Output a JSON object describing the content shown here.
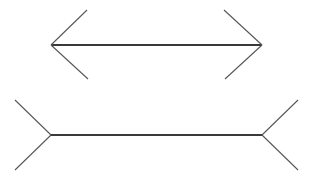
{
  "canvas": {
    "width": 311,
    "height": 178,
    "background": "#ffffff",
    "title": "Muller-Lyer illusion figure"
  },
  "style": {
    "shaft_color": "#3a3a3a",
    "shaft_width": 1.6,
    "fin_color": "#545454",
    "fin_width": 1.05
  },
  "figures": [
    {
      "name": "top-figure",
      "description": "horizontal line with outward-pointing arrowheads (arrows-in / wings pointing outward from ends)",
      "shaft": {
        "x1": 51,
        "y1": 45,
        "x2": 262,
        "y2": 45,
        "length": 211
      },
      "fins": [
        {
          "name": "top-left-upper-fin",
          "x1": 51,
          "y1": 45,
          "x2": 87,
          "y2": 10
        },
        {
          "name": "top-left-lower-fin",
          "x1": 51,
          "y1": 45,
          "x2": 88,
          "y2": 79
        },
        {
          "name": "top-right-upper-fin",
          "x1": 262,
          "y1": 45,
          "x2": 224,
          "y2": 10
        },
        {
          "name": "top-right-lower-fin",
          "x1": 262,
          "y1": 45,
          "x2": 225,
          "y2": 79
        }
      ]
    },
    {
      "name": "bottom-figure",
      "description": "horizontal line with outward-spreading fins (arrows-out / tails)",
      "shaft": {
        "x1": 51,
        "y1": 135,
        "x2": 262,
        "y2": 135,
        "length": 211
      },
      "fins": [
        {
          "name": "bottom-left-upper-fin",
          "x1": 51,
          "y1": 135,
          "x2": 15,
          "y2": 100
        },
        {
          "name": "bottom-left-lower-fin",
          "x1": 51,
          "y1": 135,
          "x2": 15,
          "y2": 170
        },
        {
          "name": "bottom-right-upper-fin",
          "x1": 262,
          "y1": 135,
          "x2": 298,
          "y2": 100
        },
        {
          "name": "bottom-right-lower-fin",
          "x1": 262,
          "y1": 135,
          "x2": 298,
          "y2": 170
        }
      ]
    }
  ]
}
